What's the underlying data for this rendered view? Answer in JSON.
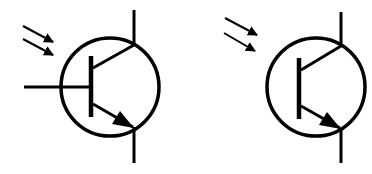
{
  "diagram": {
    "stroke_color": "#000000",
    "background": "#ffffff",
    "symbols": [
      {
        "name": "phototransistor-with-base",
        "terminals": [
          "base",
          "collector",
          "emitter"
        ],
        "light_arrows": 2
      },
      {
        "name": "phototransistor-without-base",
        "terminals": [
          "collector",
          "emitter"
        ],
        "light_arrows": 2
      }
    ]
  }
}
